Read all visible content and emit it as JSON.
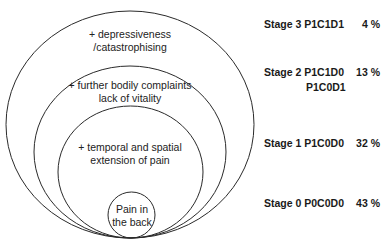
{
  "diagram": {
    "rings": [
      {
        "id": "stage3",
        "text_lines": [
          "+ depressiveness",
          "/catastrophising"
        ]
      },
      {
        "id": "stage2",
        "text_lines": [
          "+ further bodily complaints",
          "lack of vitality"
        ]
      },
      {
        "id": "stage1",
        "text_lines": [
          "+ temporal and spatial",
          "extension of pain"
        ]
      },
      {
        "id": "stage0",
        "text_lines": [
          "Pain in",
          "the back"
        ]
      }
    ],
    "stages": [
      {
        "label": "Stage 3",
        "code": "P1C1D1",
        "code2": "",
        "percent": "4 %"
      },
      {
        "label": "Stage 2",
        "code": "P1C1D0",
        "code2": "P1C0D1",
        "percent": "13 %"
      },
      {
        "label": "Stage 1",
        "code": "P1C0D0",
        "code2": "",
        "percent": "32 %"
      },
      {
        "label": "Stage 0",
        "code": "P0C0D0",
        "code2": "",
        "percent": "43 %"
      }
    ],
    "colors": {
      "stroke": "#2a2a2a",
      "background": "#ffffff"
    }
  }
}
